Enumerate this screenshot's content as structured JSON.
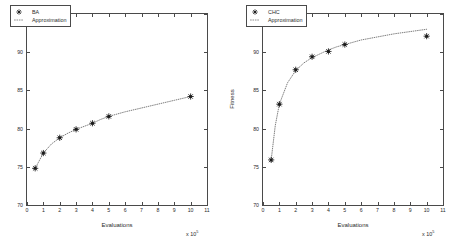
{
  "figure": {
    "background": "#ffffff",
    "axis_color": "#4a4a4a",
    "marker_color": "#1a1a1a",
    "curve_color": "#6f6f6f"
  },
  "panels": [
    {
      "id": "left",
      "legend": [
        {
          "label": "BA",
          "icon": "star-marker"
        },
        {
          "label": "Approximation",
          "icon": "dotted-line"
        }
      ],
      "xlabel": "Evaluations",
      "ylabel": "Fitness",
      "x_exponent_prefix": "x 10",
      "x_exponent": "5",
      "xticks": [
        "0",
        "1",
        "2",
        "3",
        "4",
        "5",
        "6",
        "7",
        "8",
        "9",
        "10",
        "11"
      ],
      "yticks": [
        "70",
        "75",
        "80",
        "85",
        "90",
        "95"
      ]
    },
    {
      "id": "right",
      "legend": [
        {
          "label": "CHC",
          "icon": "star-marker"
        },
        {
          "label": "Approximation",
          "icon": "dotted-line"
        }
      ],
      "xlabel": "Evaluations",
      "ylabel": "Fitness",
      "x_exponent_prefix": "x 10",
      "x_exponent": "5",
      "xticks": [
        "0",
        "1",
        "2",
        "3",
        "4",
        "5",
        "6",
        "7",
        "8",
        "9",
        "10",
        "11"
      ],
      "yticks": [
        "70",
        "75",
        "80",
        "85",
        "90",
        "95"
      ]
    }
  ],
  "chart_data": [
    {
      "type": "scatter",
      "title": "",
      "xlabel": "Evaluations",
      "ylabel": "Fitness",
      "x_unit": "x 10^5",
      "xlim": [
        0,
        11
      ],
      "ylim": [
        70,
        95
      ],
      "xticks": [
        0,
        1,
        2,
        3,
        4,
        5,
        6,
        7,
        8,
        9,
        10,
        11
      ],
      "yticks": [
        70,
        75,
        80,
        85,
        90,
        95
      ],
      "grid": false,
      "legend_position": "top-left",
      "series": [
        {
          "name": "BA",
          "style": "star-marker",
          "x": [
            0.5,
            1.0,
            2.0,
            3.0,
            4.0,
            5.0,
            10.0
          ],
          "y": [
            74.8,
            76.8,
            78.8,
            79.9,
            80.7,
            81.6,
            84.2
          ]
        },
        {
          "name": "Approximation",
          "style": "dotted-line",
          "x": [
            0.5,
            1.0,
            1.5,
            2.0,
            2.5,
            3.0,
            3.5,
            4.0,
            4.5,
            5.0,
            6.0,
            7.0,
            8.0,
            9.0,
            10.0
          ],
          "y": [
            74.8,
            76.8,
            78.0,
            78.8,
            79.4,
            79.9,
            80.3,
            80.7,
            81.2,
            81.6,
            82.2,
            82.7,
            83.2,
            83.7,
            84.2
          ]
        }
      ]
    },
    {
      "type": "scatter",
      "title": "",
      "xlabel": "Evaluations",
      "ylabel": "Fitness",
      "x_unit": "x 10^5",
      "xlim": [
        0,
        11
      ],
      "ylim": [
        70,
        95
      ],
      "xticks": [
        0,
        1,
        2,
        3,
        4,
        5,
        6,
        7,
        8,
        9,
        10,
        11
      ],
      "yticks": [
        70,
        75,
        80,
        85,
        90,
        95
      ],
      "grid": false,
      "legend_position": "top-left",
      "series": [
        {
          "name": "CHC",
          "style": "star-marker",
          "x": [
            0.5,
            1.0,
            2.0,
            3.0,
            4.0,
            5.0,
            10.0
          ],
          "y": [
            75.9,
            83.2,
            87.7,
            89.4,
            90.1,
            91.0,
            92.1
          ]
        },
        {
          "name": "Approximation",
          "style": "dotted-line",
          "x": [
            0.5,
            0.75,
            1.0,
            1.5,
            2.0,
            2.5,
            3.0,
            3.5,
            4.0,
            4.5,
            5.0,
            6.0,
            7.0,
            8.0,
            9.0,
            10.0
          ],
          "y": [
            75.9,
            80.4,
            83.2,
            86.0,
            87.6,
            88.6,
            89.3,
            89.8,
            90.3,
            90.7,
            91.0,
            91.6,
            92.0,
            92.4,
            92.7,
            93.0
          ]
        }
      ]
    }
  ]
}
